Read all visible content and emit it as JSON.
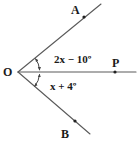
{
  "figure": {
    "type": "geometry-angle-diagram",
    "background_color": "#ffffff",
    "stroke_color": "#555555",
    "text_color": "#1a1a1a",
    "vertex": {
      "name": "O",
      "label": "O",
      "x": 18,
      "y": 72
    },
    "rays": [
      {
        "name": "ray-OA",
        "endpoint_label": "A",
        "from": [
          18,
          72
        ],
        "to": [
          101,
          4
        ]
      },
      {
        "name": "ray-OP",
        "endpoint_label": "P",
        "from": [
          18,
          72
        ],
        "to": [
          136,
          72
        ]
      },
      {
        "name": "ray-OB",
        "endpoint_label": "B",
        "from": [
          18,
          72
        ],
        "to": [
          90,
          134
        ]
      }
    ],
    "points": [
      {
        "name": "point-A",
        "label": "A",
        "dot_x": 84,
        "dot_y": 17
      },
      {
        "name": "point-P",
        "label": "P",
        "dot_x": 115,
        "dot_y": 72
      },
      {
        "name": "point-B",
        "label": "B",
        "dot_x": 75,
        "dot_y": 121
      },
      {
        "name": "point-O",
        "label": "O",
        "dot_x": 18,
        "dot_y": 72
      }
    ],
    "angles": [
      {
        "name": "angle-AOP",
        "label": "2x − 10º",
        "between": [
          "ray-OA",
          "ray-OP"
        ]
      },
      {
        "name": "angle-POB",
        "label": "x + 4º",
        "between": [
          "ray-OP",
          "ray-OB"
        ]
      }
    ]
  }
}
